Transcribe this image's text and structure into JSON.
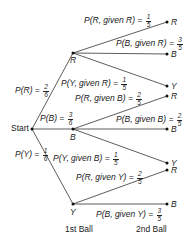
{
  "diagram": {
    "type": "probability-tree",
    "root": {
      "label": "Start"
    },
    "first_level": [
      {
        "node": "R",
        "label_prefix": "P(R) = ",
        "num": "2",
        "den": "6"
      },
      {
        "node": "B",
        "label_prefix": "P(B) = ",
        "num": "3",
        "den": "6"
      },
      {
        "node": "Y",
        "label_prefix": "P(Y) = ",
        "num": "1",
        "den": "6"
      }
    ],
    "second_level": [
      {
        "from": "R",
        "leaf": "R",
        "label_prefix": "P(R, given R) = ",
        "num": "1",
        "den": "5"
      },
      {
        "from": "R",
        "leaf": "B",
        "label_prefix": "P(B, given R) = ",
        "num": "3",
        "den": "5"
      },
      {
        "from": "R",
        "leaf": "Y",
        "label_prefix": "P(Y, given R) = ",
        "num": "1",
        "den": "5"
      },
      {
        "from": "B",
        "leaf": "R",
        "label_prefix": "P(R, given B) = ",
        "num": "2",
        "den": "5"
      },
      {
        "from": "B",
        "leaf": "B",
        "label_prefix": "P(B, given B) = ",
        "num": "2",
        "den": "5"
      },
      {
        "from": "B",
        "leaf": "Y",
        "label_prefix": "P(Y, given B) = ",
        "num": "1",
        "den": "5"
      },
      {
        "from": "Y",
        "leaf": "R",
        "label_prefix": "P(R, given Y) = ",
        "num": "2",
        "den": "5"
      },
      {
        "from": "Y",
        "leaf": "B",
        "label_prefix": "P(B, given Y) = ",
        "num": "3",
        "den": "5"
      }
    ],
    "axis_labels": {
      "first": "1st Ball",
      "second": "2nd Ball"
    }
  }
}
